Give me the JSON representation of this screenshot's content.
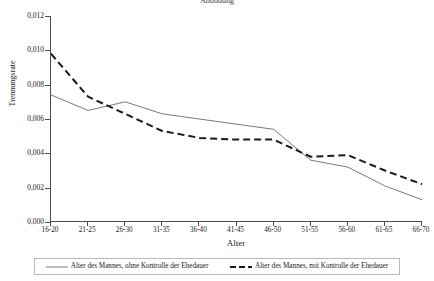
{
  "figure": {
    "title_fragment": "Abbildung",
    "background_color": "#ffffff"
  },
  "chart_data": {
    "type": "line",
    "title": "",
    "xlabel": "Alter",
    "ylabel": "Trennungsrate",
    "categories": [
      "16-20",
      "21-25",
      "26-30",
      "31-35",
      "36-40",
      "41-45",
      "46-50",
      "51-55",
      "56-60",
      "61-65",
      "66-70"
    ],
    "ylim": [
      0.0,
      0.012
    ],
    "ytick_labels": [
      "0,000",
      "0,002",
      "0,004",
      "0,006",
      "0,008",
      "0,010",
      "0,012"
    ],
    "ytick_values": [
      0.0,
      0.002,
      0.004,
      0.006,
      0.008,
      0.01,
      0.012
    ],
    "grid": false,
    "legend_position": "bottom",
    "series": [
      {
        "name": "Alter des Mannes, ohne Kontrolle der Ehedauer",
        "style": "solid",
        "color": "#7a7a7a",
        "width": 1,
        "values": [
          0.0074,
          0.0065,
          0.007,
          0.0063,
          0.006,
          0.0057,
          0.0054,
          0.0036,
          0.0032,
          0.0021,
          0.0013
        ]
      },
      {
        "name": "Alter des Mannes, mit Kontrolle der Ehedauer",
        "style": "dashed",
        "color": "#1a1a1a",
        "width": 2,
        "values": [
          0.0098,
          0.0073,
          0.0063,
          0.0053,
          0.0049,
          0.0048,
          0.0048,
          0.0038,
          0.0039,
          0.003,
          0.0022
        ]
      }
    ]
  }
}
